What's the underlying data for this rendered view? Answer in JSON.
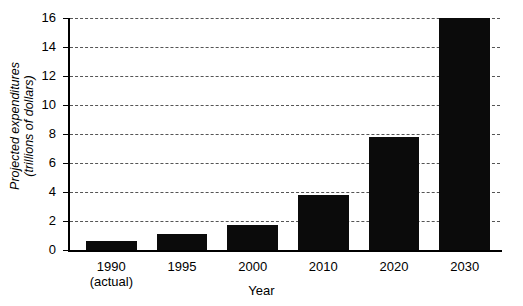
{
  "chart_data": {
    "type": "bar",
    "title": "",
    "xlabel": "Year",
    "ylabel": "Projected expenditures (trillions of dollars)",
    "ylabel_line1": "Projected expenditures",
    "ylabel_line2": "(trillions of dollars)",
    "categories": [
      "1990",
      "1995",
      "2000",
      "2010",
      "2020",
      "2030"
    ],
    "category_sublabels": [
      "(actual)",
      "",
      "",
      "",
      "",
      ""
    ],
    "values": [
      0.65,
      1.1,
      1.7,
      3.8,
      7.8,
      16.0
    ],
    "ylim": [
      0,
      16
    ],
    "yticks": [
      0,
      2,
      4,
      6,
      8,
      10,
      12,
      14,
      16
    ],
    "ytick_labels": [
      "0",
      "2",
      "4",
      "6",
      "8",
      "10",
      "12",
      "14",
      "16"
    ],
    "grid": true,
    "grid_style": "dashed-horizontal",
    "legend": "none",
    "bar_color": "#0b0b0b",
    "background_color": "#ffffff",
    "axis_color": "#000000"
  },
  "axes": {
    "y_axis_name": "projected-expenditures-axis",
    "x_axis_name": "year-axis"
  }
}
